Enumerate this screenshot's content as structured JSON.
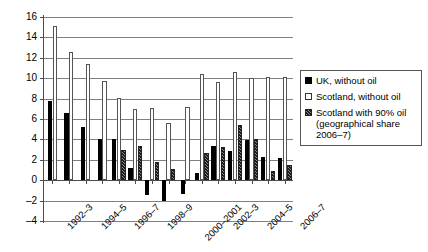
{
  "chart_data": {
    "type": "bar",
    "title": "",
    "subtitle": "",
    "xlabel": "",
    "ylabel": "",
    "ylim": [
      -4,
      16
    ],
    "ytick_step": 2,
    "yticks": [
      "16",
      "14",
      "12",
      "10",
      "8",
      "6",
      "4",
      "2",
      "0",
      "-2",
      "-4"
    ],
    "grid": true,
    "legend_position": "right",
    "categories": [
      "1992–3",
      "1993–4",
      "1994–5",
      "1995–6",
      "1996–7",
      "1997–8",
      "1998–9",
      "1999–2000",
      "2000–2001",
      "2001–2",
      "2002–3",
      "2003–4",
      "2004–5",
      "2005–6",
      "2006–7"
    ],
    "visible_tick_labels": [
      "1992–3",
      "1994–5",
      "1996–7",
      "1998–9",
      "2000–2001",
      "2002–3",
      "2004–5",
      "2006–7"
    ],
    "series": [
      {
        "name": "UK, without oil",
        "key": "uk",
        "color": "#000000",
        "style": "solid-black",
        "values": [
          7.8,
          6.6,
          5.2,
          4.0,
          4.0,
          1.2,
          -1.5,
          -2.0,
          -1.4,
          0.7,
          3.4,
          2.9,
          3.9,
          2.3,
          2.2
        ]
      },
      {
        "name": "Scotland, without oil",
        "key": "scotland",
        "color": "#ffffff",
        "style": "open-white",
        "values": [
          15.1,
          12.6,
          11.4,
          9.7,
          8.1,
          7.0,
          7.1,
          5.6,
          7.2,
          10.4,
          9.6,
          10.6,
          10.0,
          10.1,
          10.1
        ]
      },
      {
        "name": "Scotland with 90% oil (geographical share 2006–7)",
        "key": "scotland_oil",
        "color": "#8a8a8a",
        "style": "hatched-grey",
        "values": [
          null,
          null,
          null,
          null,
          3.0,
          3.4,
          1.8,
          1.1,
          null,
          2.7,
          3.3,
          5.4,
          4.0,
          0.9,
          1.5
        ]
      }
    ]
  },
  "legend": {
    "items": [
      {
        "label": "UK, without oil",
        "swatch": "solid-black-swatch"
      },
      {
        "label": "Scotland, without oil",
        "swatch": "open-white-swatch"
      },
      {
        "label": "Scotland with 90% oil",
        "label_line2": "(geographical share",
        "label_line3": "2006–7)",
        "swatch": "hatched-grey-swatch"
      }
    ]
  }
}
